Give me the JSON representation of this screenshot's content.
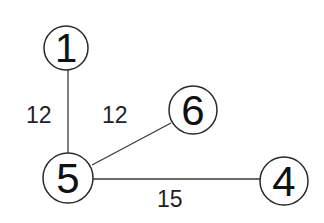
{
  "diagram": {
    "type": "weighted-undirected-graph",
    "nodes": [
      {
        "id": "1",
        "label": "1",
        "cx": 66,
        "cy": 48,
        "r": 22
      },
      {
        "id": "5",
        "label": "5",
        "cx": 68,
        "cy": 178,
        "r": 25
      },
      {
        "id": "6",
        "label": "6",
        "cx": 193,
        "cy": 110,
        "r": 24
      },
      {
        "id": "4",
        "label": "4",
        "cx": 284,
        "cy": 181,
        "r": 24
      }
    ],
    "edges": [
      {
        "from": "1",
        "to": "5",
        "weight": "12"
      },
      {
        "from": "5",
        "to": "6",
        "weight": "12"
      },
      {
        "from": "5",
        "to": "4",
        "weight": "15"
      }
    ]
  },
  "labels": {
    "node_1": "1",
    "node_5": "5",
    "node_6": "6",
    "node_4": "4",
    "edge_1_5": "12",
    "edge_5_6": "12",
    "edge_5_4": "15"
  }
}
